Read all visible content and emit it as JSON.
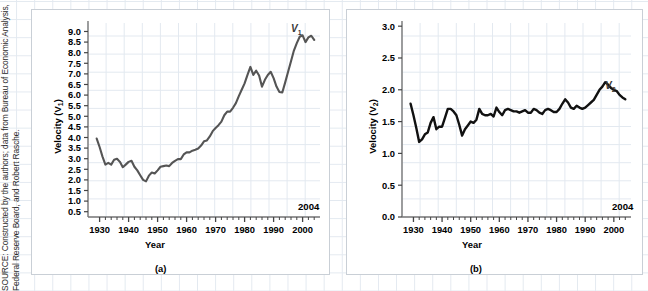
{
  "figure": {
    "source_note": "SOURCE: Constructed by the authors; data from Bureau of Economic Analysis, Federal Reserve Board, and Robert Rasche.",
    "background_grid_color": "#dfe6ee",
    "panel_border_color": "#c9cfd6"
  },
  "panels": [
    {
      "id": "a",
      "caption": "(a)",
      "end_year_label": "2004",
      "series_label": "V",
      "series_subscript": "1",
      "line_color": "#555555"
    },
    {
      "id": "b",
      "caption": "(b)",
      "end_year_label": "2004",
      "series_label": "V",
      "series_subscript": "2",
      "line_color": "#111111"
    }
  ],
  "chart_data": [
    {
      "type": "line",
      "title": "",
      "xlabel": "Year",
      "ylabel": "Velocity (V1)",
      "ylabel_text": "Velocity (V",
      "ylabel_sub": "1",
      "ylabel_tail": ")",
      "xlim": [
        1926,
        2006
      ],
      "ylim": [
        0.25,
        9.4
      ],
      "grid": true,
      "legend": "none",
      "yticks": [
        0.5,
        1.0,
        1.5,
        2.0,
        2.5,
        3.0,
        3.5,
        4.0,
        4.5,
        5.0,
        5.5,
        6.0,
        6.5,
        7.0,
        7.5,
        8.0,
        8.5,
        9.0
      ],
      "ytick_labels": [
        "0.5",
        "1.0",
        "1.5",
        "2.0",
        "2.5",
        "3.0",
        "3.5",
        "4.0",
        "4.5",
        "5.0",
        "5.5",
        "6.0",
        "6.5",
        "7.0",
        "7.5",
        "8.0",
        "8.5",
        "9.0"
      ],
      "xticks": [
        1930,
        1940,
        1950,
        1960,
        1970,
        1980,
        1990,
        2000
      ],
      "xtick_labels": [
        "1930",
        "1940",
        "1950",
        "1960",
        "1970",
        "1980",
        "1990",
        "2000"
      ],
      "annotations": [
        {
          "text": "V1",
          "x": 2000,
          "y": 9.1
        },
        {
          "text": "2004",
          "x": 2004,
          "y": 0.9
        }
      ],
      "series": [
        {
          "name": "V1",
          "x": [
            1929,
            1930,
            1931,
            1932,
            1933,
            1934,
            1935,
            1936,
            1937,
            1938,
            1939,
            1940,
            1941,
            1942,
            1943,
            1944,
            1945,
            1946,
            1947,
            1948,
            1949,
            1950,
            1951,
            1952,
            1953,
            1954,
            1955,
            1956,
            1957,
            1958,
            1959,
            1960,
            1961,
            1962,
            1963,
            1964,
            1965,
            1966,
            1967,
            1968,
            1969,
            1970,
            1971,
            1972,
            1973,
            1974,
            1975,
            1976,
            1977,
            1978,
            1979,
            1980,
            1981,
            1982,
            1983,
            1984,
            1985,
            1986,
            1987,
            1988,
            1989,
            1990,
            1991,
            1992,
            1993,
            1994,
            1995,
            1996,
            1997,
            1998,
            1999,
            2000,
            2001,
            2002,
            2003,
            2004
          ],
          "values": [
            3.95,
            3.55,
            3.1,
            2.72,
            2.8,
            2.72,
            2.95,
            3.0,
            2.85,
            2.6,
            2.72,
            2.85,
            2.9,
            2.62,
            2.45,
            2.22,
            2.0,
            1.93,
            2.2,
            2.35,
            2.3,
            2.45,
            2.62,
            2.65,
            2.68,
            2.65,
            2.8,
            2.9,
            2.98,
            2.98,
            3.2,
            3.3,
            3.3,
            3.38,
            3.42,
            3.48,
            3.62,
            3.82,
            3.86,
            4.05,
            4.3,
            4.45,
            4.58,
            4.75,
            5.05,
            5.22,
            5.22,
            5.4,
            5.62,
            5.95,
            6.25,
            6.55,
            6.95,
            7.33,
            6.95,
            7.15,
            6.92,
            6.4,
            6.72,
            6.95,
            7.1,
            6.8,
            6.4,
            6.15,
            6.12,
            6.6,
            7.1,
            7.6,
            8.1,
            8.45,
            8.75,
            8.82,
            8.5,
            8.72,
            8.8,
            8.6
          ]
        }
      ]
    },
    {
      "type": "line",
      "title": "",
      "xlabel": "Year",
      "ylabel": "Velocity (V2)",
      "ylabel_text": "Velocity (V",
      "ylabel_sub": "2",
      "ylabel_tail": ")",
      "xlim": [
        1926,
        2006
      ],
      "ylim": [
        0.0,
        3.05
      ],
      "grid": true,
      "legend": "none",
      "yticks": [
        0.0,
        0.5,
        1.0,
        1.5,
        2.0,
        2.5,
        3.0
      ],
      "ytick_labels": [
        "0.0",
        "0.5",
        "1.0",
        "1.5",
        "2.0",
        "2.5",
        "3.0"
      ],
      "xticks": [
        1930,
        1940,
        1950,
        1960,
        1970,
        1980,
        1990,
        2000
      ],
      "xtick_labels": [
        "1930",
        "1940",
        "1950",
        "1960",
        "1970",
        "1980",
        "1990",
        "2000"
      ],
      "annotations": [
        {
          "text": "V2",
          "x": 2001,
          "y": 2.03
        },
        {
          "text": "2004",
          "x": 2004,
          "y": 0.22
        }
      ],
      "series": [
        {
          "name": "V2",
          "x": [
            1929,
            1930,
            1931,
            1932,
            1933,
            1934,
            1935,
            1936,
            1937,
            1938,
            1939,
            1940,
            1941,
            1942,
            1943,
            1944,
            1945,
            1946,
            1947,
            1948,
            1949,
            1950,
            1951,
            1952,
            1953,
            1954,
            1955,
            1956,
            1957,
            1958,
            1959,
            1960,
            1961,
            1962,
            1963,
            1964,
            1965,
            1966,
            1967,
            1968,
            1969,
            1970,
            1971,
            1972,
            1973,
            1974,
            1975,
            1976,
            1977,
            1978,
            1979,
            1980,
            1981,
            1982,
            1983,
            1984,
            1985,
            1986,
            1987,
            1988,
            1989,
            1990,
            1991,
            1992,
            1993,
            1994,
            1995,
            1996,
            1997,
            1998,
            1999,
            2000,
            2001,
            2002,
            2003,
            2004
          ],
          "values": [
            1.78,
            1.6,
            1.4,
            1.18,
            1.22,
            1.3,
            1.33,
            1.48,
            1.57,
            1.38,
            1.42,
            1.42,
            1.56,
            1.7,
            1.7,
            1.66,
            1.6,
            1.45,
            1.28,
            1.38,
            1.44,
            1.5,
            1.48,
            1.53,
            1.7,
            1.62,
            1.6,
            1.6,
            1.62,
            1.58,
            1.72,
            1.65,
            1.6,
            1.68,
            1.7,
            1.68,
            1.66,
            1.66,
            1.64,
            1.66,
            1.68,
            1.64,
            1.64,
            1.7,
            1.68,
            1.64,
            1.62,
            1.68,
            1.7,
            1.68,
            1.65,
            1.65,
            1.7,
            1.78,
            1.85,
            1.8,
            1.72,
            1.7,
            1.75,
            1.72,
            1.7,
            1.72,
            1.76,
            1.8,
            1.84,
            1.92,
            2.0,
            2.05,
            2.12,
            2.08,
            2.03,
            2.0,
            1.98,
            1.92,
            1.88,
            1.85
          ]
        }
      ]
    }
  ]
}
